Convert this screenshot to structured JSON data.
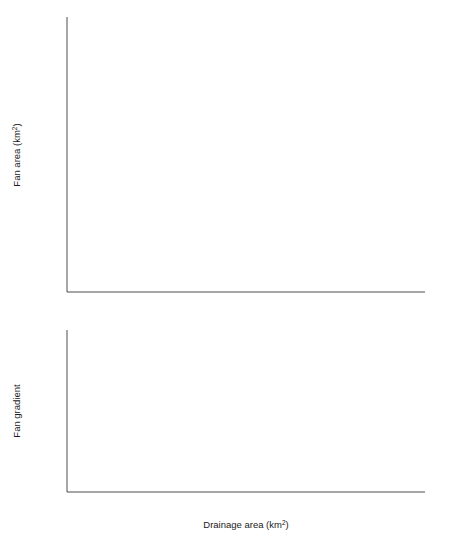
{
  "legend": {
    "items": [
      {
        "label": "Dissected fans (Base-level related)",
        "open_marker": "open-square",
        "filled_marker": "filled-square"
      },
      {
        "label": "Dissected fans (Mid-fan dissection)",
        "open_marker": "open-triangle",
        "filled_marker": "filled-triangle"
      },
      {
        "label": "Aggrading/prograding fans",
        "open_marker": "open-circle",
        "filled_marker": "filled-circle"
      }
    ]
  },
  "chart_data": [
    {
      "type": "scatter",
      "panel": "top",
      "title": "SPANISH FANS",
      "xlabel": "Drainage area (km2)",
      "ylabel": "Fan area (km2)",
      "xscale": "log",
      "yscale": "log",
      "xlim": [
        0.1,
        200
      ],
      "ylim": [
        0.05,
        20
      ],
      "xticks": [
        0.1,
        0.2,
        0.5,
        1,
        2,
        5,
        10,
        20,
        50,
        100,
        200
      ],
      "xticklabels": [
        "0.1",
        "0.2",
        "0.5",
        "1",
        "2",
        "5",
        "10",
        "20",
        "50",
        "100",
        "200"
      ],
      "yticks": [
        0.05,
        0.1,
        0.2,
        0.5,
        1,
        2,
        5,
        10,
        20
      ],
      "yticklabels": [
        "0.05",
        "0.1",
        "0.2",
        "0.5",
        "1",
        "2",
        "5",
        "10",
        "20"
      ],
      "grid": false,
      "trendline": {
        "x": [
          0.1,
          130
        ],
        "y": [
          0.163,
          18.5
        ]
      },
      "series": [
        {
          "name": "Dissected fans (Base-level related)",
          "marker": "filled-square",
          "points": [
            [
              0.105,
              0.152
            ],
            [
              0.108,
              0.146
            ],
            [
              0.25,
              0.31
            ],
            [
              0.33,
              0.31
            ],
            [
              0.55,
              0.345
            ],
            [
              0.72,
              0.295
            ],
            [
              1.35,
              0.92
            ],
            [
              1.9,
              0.88
            ],
            [
              2.0,
              0.845
            ],
            [
              2.35,
              0.85
            ],
            [
              2.45,
              0.83
            ],
            [
              3.3,
              0.78
            ],
            [
              3.6,
              1.22
            ],
            [
              4.2,
              1.25
            ],
            [
              4.35,
              1.18
            ],
            [
              4.5,
              6.3
            ],
            [
              2.8,
              1.0
            ]
          ]
        },
        {
          "name": "Dissected fans (Base-level related) open",
          "marker": "open-square",
          "points": [
            [
              1.75,
              0.38
            ],
            [
              1.95,
              0.28
            ],
            [
              2.0,
              0.205
            ],
            [
              2.05,
              0.15
            ],
            [
              4.5,
              6.4
            ],
            [
              4.4,
              1.2
            ],
            [
              3.4,
              0.95
            ]
          ]
        },
        {
          "name": "Dissected fans (Mid-fan dissection)",
          "marker": "filled-triangle",
          "points": [
            [
              0.52,
              0.275
            ],
            [
              0.72,
              0.255
            ],
            [
              1.45,
              1.22
            ],
            [
              1.55,
              1.2
            ],
            [
              2.35,
              0.305
            ],
            [
              2.9,
              0.29
            ],
            [
              3.5,
              1.62
            ],
            [
              4.3,
              5.1
            ],
            [
              4.5,
              3.5
            ],
            [
              4.4,
              6.6
            ],
            [
              3.2,
              1.35
            ]
          ]
        },
        {
          "name": "Dissected fans (Mid-fan dissection) open",
          "marker": "open-triangle",
          "points": [
            [
              1.25,
              0.92
            ],
            [
              2.7,
              0.39
            ],
            [
              1.5,
              1.05
            ],
            [
              6.5,
              19.5
            ],
            [
              8.5,
              17.0
            ]
          ]
        },
        {
          "name": "Aggrading/prograding fans",
          "marker": "filled-circle",
          "points": [
            [
              0.105,
              0.155
            ],
            [
              0.15,
              0.12
            ],
            [
              0.33,
              0.53
            ],
            [
              0.42,
              0.55
            ],
            [
              0.47,
              0.53
            ],
            [
              0.48,
              0.13
            ],
            [
              0.52,
              0.42
            ],
            [
              0.38,
              0.215
            ],
            [
              0.31,
              0.22
            ],
            [
              0.95,
              1.05
            ],
            [
              1.1,
              0.95
            ],
            [
              1.15,
              0.88
            ],
            [
              1.2,
              0.84
            ],
            [
              1.25,
              0.79
            ],
            [
              1.3,
              0.75
            ],
            [
              1.55,
              1.3
            ],
            [
              1.7,
              1.22
            ],
            [
              1.9,
              1.25
            ],
            [
              2.1,
              1.2
            ],
            [
              2.2,
              0.86
            ],
            [
              1.75,
              0.55
            ],
            [
              2.3,
              0.78
            ],
            [
              2.55,
              0.98
            ],
            [
              2.7,
              2.7
            ],
            [
              3.0,
              2.45
            ],
            [
              3.2,
              2.75
            ],
            [
              3.05,
              2.05
            ],
            [
              3.5,
              5.0
            ],
            [
              3.6,
              4.3
            ],
            [
              3.9,
              2.5
            ],
            [
              4.1,
              2.5
            ],
            [
              4.3,
              1.35
            ],
            [
              4.4,
              1.12
            ],
            [
              4.2,
              1.05
            ],
            [
              5.3,
              1.0
            ],
            [
              6.0,
              2.7
            ],
            [
              6.3,
              1.9
            ],
            [
              7.5,
              6.3
            ],
            [
              8.5,
              5.7
            ],
            [
              9.5,
              2.9
            ],
            [
              11.0,
              7.8
            ],
            [
              13.0,
              10.8
            ],
            [
              15.0,
              3.8
            ],
            [
              45.0,
              7.7
            ],
            [
              60.0,
              18.5
            ],
            [
              75.0,
              11.5
            ],
            [
              2.45,
              1.18
            ],
            [
              2.6,
              1.25
            ],
            [
              5.6,
              1.45
            ]
          ]
        },
        {
          "name": "Aggrading/prograding fans open",
          "marker": "open-circle",
          "points": [
            [
              0.135,
              0.275
            ],
            [
              0.16,
              0.195
            ],
            [
              0.19,
              0.155
            ],
            [
              0.22,
              0.175
            ],
            [
              0.28,
              0.245
            ],
            [
              0.58,
              0.305
            ],
            [
              1.1,
              1.05
            ],
            [
              5.0,
              1.45
            ]
          ]
        }
      ]
    },
    {
      "type": "scatter",
      "panel": "bottom",
      "xlabel": "Drainage area (km2)",
      "ylabel": "Fan gradient",
      "xscale": "log",
      "yscale": "log",
      "xlim": [
        0.1,
        200
      ],
      "ylim": [
        0.01,
        0.2
      ],
      "xticks": [
        0.1,
        0.2,
        0.5,
        1,
        2,
        5,
        10,
        20,
        50,
        100,
        200
      ],
      "xticklabels": [
        "0.1",
        "0.2",
        "0.5",
        "1",
        "2",
        "5",
        "10",
        "20",
        "50",
        "100",
        "200"
      ],
      "yticks": [
        0.01,
        0.02,
        0.05,
        0.1,
        0.2
      ],
      "yticklabels": [
        "0.01",
        "0.02",
        "0.05",
        "0.1",
        "0.2"
      ],
      "grid": false,
      "trendline": {
        "x": [
          0.1,
          110
        ],
        "y": [
          0.115,
          0.0235
        ]
      },
      "series": [
        {
          "name": "Dissected fans (Base-level related)",
          "marker": "filled-square",
          "points": [
            [
              0.21,
              0.155
            ],
            [
              0.38,
              0.125
            ],
            [
              0.29,
              0.105
            ],
            [
              2.1,
              0.063
            ],
            [
              3.5,
              0.062
            ],
            [
              3.3,
              0.064
            ]
          ]
        },
        {
          "name": "Dissected fans (Base-level related) open",
          "marker": "open-square",
          "points": [
            [
              0.27,
              0.135
            ],
            [
              0.95,
              0.072
            ],
            [
              2.35,
              0.068
            ],
            [
              3.0,
              0.073
            ],
            [
              4.6,
              0.093
            ],
            [
              6.3,
              0.072
            ],
            [
              11.0,
              0.052
            ],
            [
              17.0,
              0.05
            ],
            [
              0.52,
              0.043
            ]
          ]
        },
        {
          "name": "Dissected fans (Mid-fan dissection)",
          "marker": "filled-triangle",
          "points": [
            [
              0.105,
              0.075
            ],
            [
              0.105,
              0.055
            ],
            [
              0.24,
              0.08
            ],
            [
              1.35,
              0.155
            ],
            [
              1.85,
              0.125
            ],
            [
              2.3,
              0.095
            ],
            [
              3.6,
              0.15
            ],
            [
              6.5,
              0.105
            ],
            [
              7.5,
              0.108
            ],
            [
              8.2,
              0.088
            ],
            [
              9.0,
              0.082
            ],
            [
              10.5,
              0.078
            ],
            [
              13.0,
              0.09
            ],
            [
              22.0,
              0.042
            ]
          ]
        },
        {
          "name": "Dissected fans (Mid-fan dissection) open",
          "marker": "open-triangle",
          "points": [
            [
              0.26,
              0.078
            ],
            [
              1.25,
              0.031
            ],
            [
              3.4,
              0.068
            ],
            [
              5.0,
              0.048
            ],
            [
              7.5,
              0.048
            ],
            [
              8.0,
              0.088
            ],
            [
              11.0,
              0.077
            ]
          ]
        },
        {
          "name": "Aggrading/prograding fans",
          "marker": "filled-circle",
          "points": [
            [
              0.105,
              0.085
            ],
            [
              0.3,
              0.105
            ],
            [
              0.29,
              0.1
            ],
            [
              0.42,
              0.098
            ],
            [
              0.38,
              0.078
            ],
            [
              0.45,
              0.068
            ],
            [
              0.55,
              0.082
            ],
            [
              0.62,
              0.038
            ],
            [
              0.85,
              0.08
            ],
            [
              1.0,
              0.078
            ],
            [
              1.45,
              0.062
            ],
            [
              1.6,
              0.068
            ],
            [
              1.75,
              0.072
            ],
            [
              1.9,
              0.065
            ],
            [
              2.0,
              0.058
            ],
            [
              2.05,
              0.048
            ],
            [
              2.2,
              0.062
            ],
            [
              2.3,
              0.066
            ],
            [
              2.4,
              0.058
            ],
            [
              2.5,
              0.052
            ],
            [
              2.6,
              0.06
            ],
            [
              2.75,
              0.055
            ],
            [
              2.9,
              0.05
            ],
            [
              3.1,
              0.051
            ],
            [
              3.2,
              0.072
            ],
            [
              3.4,
              0.058
            ],
            [
              3.6,
              0.06
            ],
            [
              4.0,
              0.032
            ],
            [
              4.5,
              0.088
            ],
            [
              5.2,
              0.085
            ],
            [
              6.0,
              0.09
            ],
            [
              6.8,
              0.092
            ],
            [
              7.2,
              0.045
            ],
            [
              7.8,
              0.043
            ],
            [
              8.0,
              0.04
            ],
            [
              9.5,
              0.058
            ],
            [
              10.5,
              0.065
            ],
            [
              11.5,
              0.072
            ],
            [
              13.0,
              0.063
            ],
            [
              14.0,
              0.06
            ],
            [
              17.0,
              0.082
            ],
            [
              19.0,
              0.082
            ],
            [
              23.0,
              0.048
            ],
            [
              26.0,
              0.042
            ],
            [
              32.0,
              0.05
            ],
            [
              40.0,
              0.028
            ],
            [
              62.0,
              0.032
            ],
            [
              78.0,
              0.044
            ],
            [
              80.0,
              0.042
            ],
            [
              85.0,
              0.038
            ],
            [
              2.8,
              0.038
            ],
            [
              1.2,
              0.047
            ],
            [
              0.85,
              0.05
            ]
          ]
        },
        {
          "name": "Aggrading/prograding fans open",
          "marker": "open-circle",
          "points": [
            [
              0.25,
              0.115
            ],
            [
              0.23,
              0.088
            ],
            [
              0.26,
              0.082
            ],
            [
              0.28,
              0.082
            ],
            [
              0.175,
              0.125
            ],
            [
              1.55,
              0.063
            ],
            [
              2.9,
              0.022
            ],
            [
              5.5,
              0.095
            ],
            [
              20.0,
              0.058
            ]
          ]
        }
      ]
    }
  ]
}
